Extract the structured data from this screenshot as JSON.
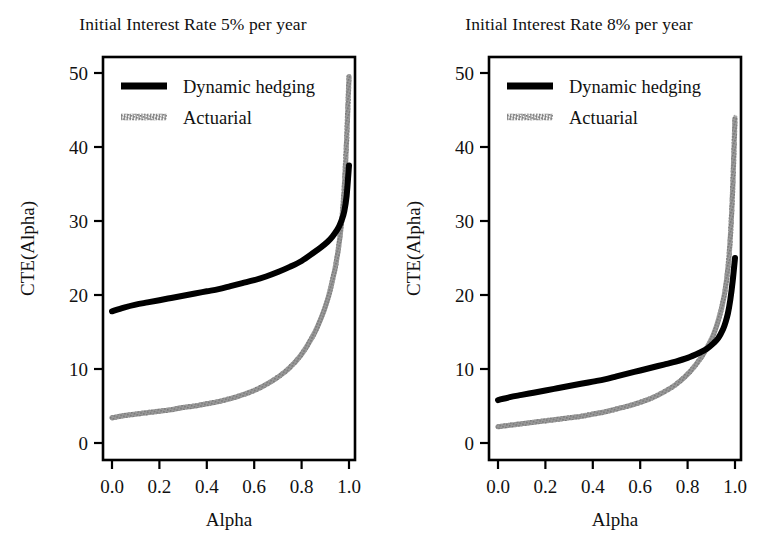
{
  "figure": {
    "background": "#ffffff",
    "series_colors": {
      "dynamic_hedging": "#000000",
      "actuarial": "#8c8c8c"
    }
  },
  "panels": [
    {
      "id": "panel-5pct",
      "title": "Initial Interest Rate 5% per year",
      "xlabel": "Alpha",
      "ylabel": "CTE(Alpha)",
      "xticks": [
        "0.0",
        "0.2",
        "0.4",
        "0.6",
        "0.8",
        "1.0"
      ],
      "yticks": [
        "0",
        "10",
        "20",
        "30",
        "40",
        "50"
      ],
      "legend": [
        {
          "label": "Dynamic hedging",
          "style": "solid-thick-black"
        },
        {
          "label": "Actuarial",
          "style": "hatched-gray"
        }
      ]
    },
    {
      "id": "panel-8pct",
      "title": "Initial Interest Rate 8% per year",
      "xlabel": "Alpha",
      "ylabel": "CTE(Alpha)",
      "xticks": [
        "0.0",
        "0.2",
        "0.4",
        "0.6",
        "0.8",
        "1.0"
      ],
      "yticks": [
        "0",
        "10",
        "20",
        "30",
        "40",
        "50"
      ],
      "legend": [
        {
          "label": "Dynamic hedging",
          "style": "solid-thick-black"
        },
        {
          "label": "Actuarial",
          "style": "hatched-gray"
        }
      ]
    }
  ],
  "chart_data": [
    {
      "type": "line",
      "title": "Initial Interest Rate 5% per year",
      "xlabel": "Alpha",
      "ylabel": "CTE(Alpha)",
      "xlim": [
        0.0,
        1.0
      ],
      "ylim": [
        0,
        50
      ],
      "xticks": [
        0.0,
        0.2,
        0.4,
        0.6,
        0.8,
        1.0
      ],
      "yticks": [
        0,
        10,
        20,
        30,
        40,
        50
      ],
      "grid": false,
      "legend_position": "top-left-inside",
      "series": [
        {
          "name": "Dynamic hedging",
          "color": "#000000",
          "x": [
            0.0,
            0.05,
            0.1,
            0.15,
            0.2,
            0.25,
            0.3,
            0.35,
            0.4,
            0.45,
            0.5,
            0.55,
            0.6,
            0.65,
            0.7,
            0.75,
            0.8,
            0.85,
            0.88,
            0.91,
            0.93,
            0.95,
            0.96,
            0.97,
            0.98,
            0.99,
            1.0
          ],
          "values": [
            17.8,
            18.3,
            18.7,
            19.0,
            19.3,
            19.6,
            19.9,
            20.2,
            20.5,
            20.8,
            21.2,
            21.6,
            22.0,
            22.5,
            23.1,
            23.8,
            24.6,
            25.7,
            26.4,
            27.2,
            27.9,
            28.8,
            29.4,
            30.2,
            31.3,
            33.4,
            37.5
          ]
        },
        {
          "name": "Actuarial",
          "color": "#8c8c8c",
          "x": [
            0.0,
            0.05,
            0.1,
            0.15,
            0.2,
            0.25,
            0.3,
            0.35,
            0.4,
            0.45,
            0.5,
            0.55,
            0.6,
            0.65,
            0.7,
            0.75,
            0.8,
            0.85,
            0.88,
            0.9,
            0.92,
            0.94,
            0.95,
            0.96,
            0.97,
            0.98,
            0.99,
            1.0
          ],
          "values": [
            3.4,
            3.7,
            3.9,
            4.1,
            4.3,
            4.5,
            4.8,
            5.0,
            5.3,
            5.6,
            6.0,
            6.5,
            7.1,
            7.9,
            8.9,
            10.2,
            12.0,
            14.6,
            16.7,
            18.4,
            20.6,
            23.4,
            25.2,
            27.4,
            30.3,
            34.5,
            41.0,
            49.5
          ]
        }
      ]
    },
    {
      "type": "line",
      "title": "Initial Interest Rate 8% per year",
      "xlabel": "Alpha",
      "ylabel": "CTE(Alpha)",
      "xlim": [
        0.0,
        1.0
      ],
      "ylim": [
        0,
        50
      ],
      "xticks": [
        0.0,
        0.2,
        0.4,
        0.6,
        0.8,
        1.0
      ],
      "yticks": [
        0,
        10,
        20,
        30,
        40,
        50
      ],
      "grid": false,
      "legend_position": "top-left-inside",
      "series": [
        {
          "name": "Dynamic hedging",
          "color": "#000000",
          "x": [
            0.0,
            0.05,
            0.1,
            0.15,
            0.2,
            0.25,
            0.3,
            0.35,
            0.4,
            0.45,
            0.5,
            0.55,
            0.6,
            0.65,
            0.7,
            0.75,
            0.8,
            0.85,
            0.88,
            0.91,
            0.93,
            0.95,
            0.96,
            0.97,
            0.98,
            0.99,
            1.0
          ],
          "values": [
            5.8,
            6.2,
            6.5,
            6.8,
            7.1,
            7.4,
            7.7,
            8.0,
            8.3,
            8.6,
            9.0,
            9.4,
            9.8,
            10.2,
            10.6,
            11.0,
            11.5,
            12.2,
            12.7,
            13.5,
            14.2,
            15.4,
            16.3,
            17.5,
            19.3,
            21.8,
            25.0
          ]
        },
        {
          "name": "Actuarial",
          "color": "#8c8c8c",
          "x": [
            0.0,
            0.05,
            0.1,
            0.15,
            0.2,
            0.25,
            0.3,
            0.35,
            0.4,
            0.45,
            0.5,
            0.55,
            0.6,
            0.65,
            0.7,
            0.75,
            0.8,
            0.84,
            0.87,
            0.9,
            0.92,
            0.94,
            0.95,
            0.96,
            0.97,
            0.98,
            0.99,
            1.0
          ],
          "values": [
            2.2,
            2.4,
            2.6,
            2.8,
            3.0,
            3.2,
            3.4,
            3.6,
            3.9,
            4.2,
            4.6,
            5.0,
            5.5,
            6.1,
            6.9,
            7.9,
            9.3,
            10.8,
            12.2,
            14.0,
            15.6,
            17.8,
            19.2,
            21.0,
            23.6,
            27.6,
            34.2,
            44.0
          ]
        }
      ]
    }
  ]
}
